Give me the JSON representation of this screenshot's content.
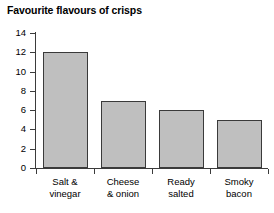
{
  "chart_data": {
    "type": "bar",
    "title": "Favourite flavours of crisps",
    "xlabel": "",
    "ylabel": "",
    "categories": [
      "Salt & vinegar",
      "Cheese & onion",
      "Ready salted",
      "Smoky bacon"
    ],
    "category_lines": [
      [
        "Salt &",
        "vinegar"
      ],
      [
        "Cheese",
        "& onion"
      ],
      [
        "Ready",
        "salted"
      ],
      [
        "Smoky",
        "bacon"
      ]
    ],
    "values": [
      12,
      7,
      6,
      5
    ],
    "ylim": [
      0,
      14
    ],
    "ytick_step": 2,
    "yticks": [
      0,
      2,
      4,
      6,
      8,
      10,
      12,
      14
    ],
    "ytick_labels": [
      "0",
      "2",
      "4",
      "6",
      "8",
      "10",
      "12",
      "14"
    ],
    "grid": false,
    "legend": false,
    "bar_fill_color": "#bfbfbf",
    "bar_border_color": "#3a3a3a",
    "axis_color": "#3b3b3b",
    "background_color": "#ffffff"
  }
}
